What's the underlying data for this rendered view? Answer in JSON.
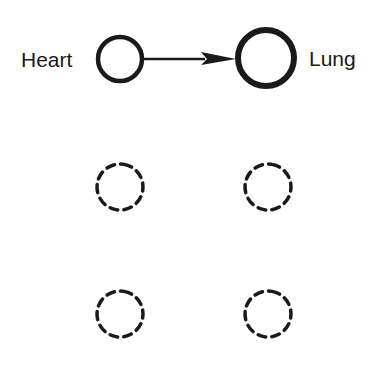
{
  "diagram": {
    "nodes": [
      {
        "id": "heart",
        "label": "Heart",
        "style": "solid",
        "cx": 120,
        "cy": 59,
        "r": 22,
        "stroke_width": 4
      },
      {
        "id": "lung",
        "label": "Lung",
        "style": "solid",
        "cx": 266,
        "cy": 58,
        "r": 28,
        "stroke_width": 6
      },
      {
        "id": "empty-1",
        "label": "",
        "style": "dashed",
        "cx": 120,
        "cy": 187,
        "r": 23
      },
      {
        "id": "empty-2",
        "label": "",
        "style": "dashed",
        "cx": 268,
        "cy": 187,
        "r": 23
      },
      {
        "id": "empty-3",
        "label": "",
        "style": "dashed",
        "cx": 120,
        "cy": 314,
        "r": 23
      },
      {
        "id": "empty-4",
        "label": "",
        "style": "dashed",
        "cx": 268,
        "cy": 314,
        "r": 23
      }
    ],
    "edges": [
      {
        "from": "heart",
        "to": "lung",
        "type": "arrow"
      }
    ],
    "labels": {
      "heart": "Heart",
      "lung": "Lung"
    },
    "colors": {
      "stroke": "#1a1a1a",
      "background": "#ffffff"
    }
  }
}
